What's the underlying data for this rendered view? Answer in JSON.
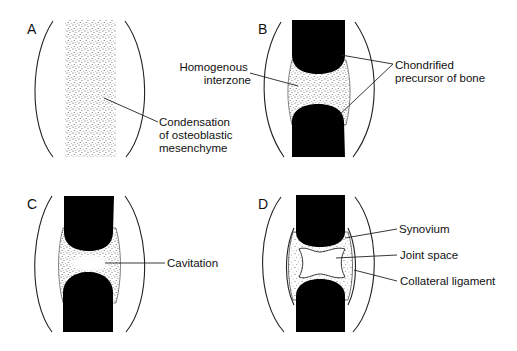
{
  "figure": {
    "colors": {
      "bone": "#000000",
      "stipple": "#555555",
      "line": "#222222",
      "background": "#ffffff"
    },
    "panels": [
      {
        "id": "A",
        "letter": "A",
        "labels": [
          {
            "lines": [
              "Condensation",
              "of osteoblastic",
              "mesenchyme"
            ]
          }
        ]
      },
      {
        "id": "B",
        "letter": "B",
        "labels": [
          {
            "lines": [
              "Homogenous",
              "interzone"
            ]
          },
          {
            "lines": [
              "Chondrified",
              "precursor of bone"
            ]
          }
        ]
      },
      {
        "id": "C",
        "letter": "C",
        "labels": [
          {
            "lines": [
              "Cavitation"
            ]
          }
        ]
      },
      {
        "id": "D",
        "letter": "D",
        "labels": [
          {
            "lines": [
              "Synovium"
            ]
          },
          {
            "lines": [
              "Joint space"
            ]
          },
          {
            "lines": [
              "Collateral ligament"
            ]
          }
        ]
      }
    ]
  }
}
